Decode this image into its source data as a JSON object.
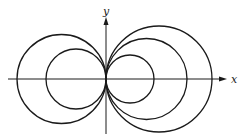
{
  "figure": {
    "axes": {
      "x_label": "x",
      "y_label": "y",
      "origin": [
        106,
        79
      ]
    },
    "circles_left": [
      {
        "cx": 61.5,
        "cy": 79,
        "r": 44.5
      },
      {
        "cx": 76,
        "cy": 79,
        "r": 30
      }
    ],
    "circles_right": [
      {
        "cx": 130,
        "cy": 79,
        "r": 24
      },
      {
        "cx": 146.5,
        "cy": 79,
        "r": 40.5
      },
      {
        "cx": 159,
        "cy": 79,
        "r": 53
      }
    ],
    "stroke_color": "#1a1a1a"
  }
}
